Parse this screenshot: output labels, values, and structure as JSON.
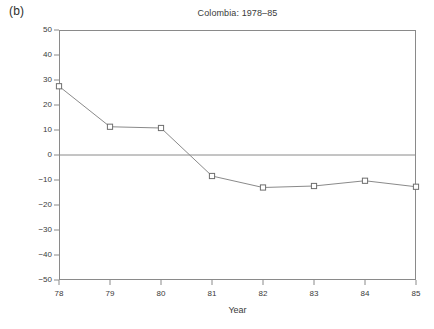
{
  "figure": {
    "panel_label": "(b)"
  },
  "chart_data": {
    "type": "line",
    "title": "Colombia: 1978–85",
    "xlabel": "Year",
    "ylabel": "Percent",
    "x": [
      78,
      79,
      80,
      81,
      82,
      83,
      84,
      85
    ],
    "xtick_labels": [
      "78",
      "79",
      "80",
      "81",
      "82",
      "83",
      "84",
      "85"
    ],
    "values": [
      27.5,
      11.3,
      10.8,
      -8.4,
      -13.0,
      -12.4,
      -10.3,
      -12.7
    ],
    "series": [
      {
        "name": "Percent",
        "values": [
          27.5,
          11.3,
          10.8,
          -8.4,
          -13.0,
          -12.4,
          -10.3,
          -12.7
        ]
      }
    ],
    "ylim": [
      -50,
      50
    ],
    "yticks": [
      50,
      40,
      30,
      20,
      10,
      0,
      -10,
      -20,
      -30,
      -40,
      -50
    ],
    "ytick_labels": [
      "50",
      "40",
      "30",
      "20",
      "10",
      "0",
      "−10",
      "−20",
      "−30",
      "−40",
      "−50"
    ],
    "xlim": [
      78,
      85
    ],
    "grid": false,
    "zero_line": true,
    "marker": "open-square",
    "legend": null,
    "line_color": "#8a8a8a",
    "marker_edge_color": "#6e6e6e",
    "marker_face_color": "#ffffff",
    "axis_color": "#8a8a8a"
  }
}
